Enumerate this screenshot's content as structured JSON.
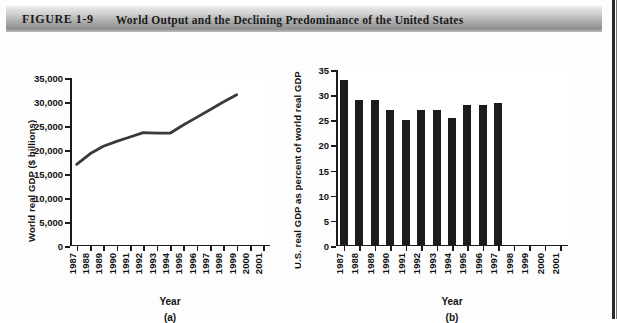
{
  "header": {
    "figure_label": "FIGURE 1-9",
    "figure_number": "1-9",
    "figure_word": "Figure",
    "title": "World Output and the Declining Predominance of the United States"
  },
  "panel_a": {
    "ylabel": "World real GDP ($ billions)",
    "xlabel": "Year",
    "caption": "(a)"
  },
  "panel_b": {
    "ylabel": "U.S. real GDP as percent of world real GDP",
    "xlabel": "Year",
    "caption": "(b)"
  },
  "colors": {
    "line": "#3a3a3a",
    "bar": "#1c1c1c",
    "axis": "#1a1a1a",
    "header_dark": "#8f8f8f",
    "header_light": "#e8e8e8"
  },
  "chart_data": [
    {
      "type": "line",
      "title": "World real GDP",
      "panel": "(a)",
      "xlabel": "Year",
      "ylabel": "World real GDP ($ billions)",
      "categories": [
        "1987",
        "1988",
        "1989",
        "1990",
        "1991",
        "1992",
        "1993",
        "1994",
        "1995",
        "1996",
        "1997",
        "1998",
        "1999",
        "2000",
        "2001"
      ],
      "x_tick_labels": [
        "1987",
        "1988",
        "1989",
        "1990",
        "1991",
        "1992",
        "1993",
        "1994",
        "1995",
        "1996",
        "1997",
        "1998",
        "1999",
        "2000",
        "2001"
      ],
      "y_tick_labels": [
        "0",
        "5,000",
        "10,000",
        "15,000",
        "20,000",
        "25,000",
        "30,000",
        "35,000"
      ],
      "y_ticks": [
        0,
        5000,
        10000,
        15000,
        20000,
        25000,
        30000,
        35000
      ],
      "ylim": [
        0,
        35000
      ],
      "values": [
        17000,
        19200,
        20800,
        21800,
        22700,
        23600,
        23500,
        23500,
        25200,
        26800,
        28400,
        30000,
        31500,
        null,
        null
      ],
      "grid": false,
      "legend": "none"
    },
    {
      "type": "bar",
      "title": "U.S. share of world real GDP",
      "panel": "(b)",
      "xlabel": "Year",
      "ylabel": "U.S. real GDP as percent of world real GDP",
      "categories": [
        "1987",
        "1988",
        "1989",
        "1990",
        "1991",
        "1992",
        "1993",
        "1994",
        "1995",
        "1996",
        "1997",
        "1998",
        "1999",
        "2000",
        "2001"
      ],
      "x_tick_labels": [
        "1987",
        "1988",
        "1989",
        "1990",
        "1991",
        "1992",
        "1993",
        "1994",
        "1995",
        "1996",
        "1997",
        "1998",
        "1999",
        "2000",
        "2001"
      ],
      "y_tick_labels": [
        "0",
        "5",
        "10",
        "15",
        "20",
        "25",
        "30",
        "35"
      ],
      "y_ticks": [
        0,
        5,
        10,
        15,
        20,
        25,
        30,
        35
      ],
      "ylim": [
        0,
        35
      ],
      "values": [
        33.0,
        29.0,
        29.0,
        27.0,
        25.0,
        27.0,
        27.0,
        25.5,
        28.0,
        28.0,
        28.5,
        null,
        null,
        null,
        null
      ],
      "grid": false,
      "legend": "none"
    }
  ]
}
